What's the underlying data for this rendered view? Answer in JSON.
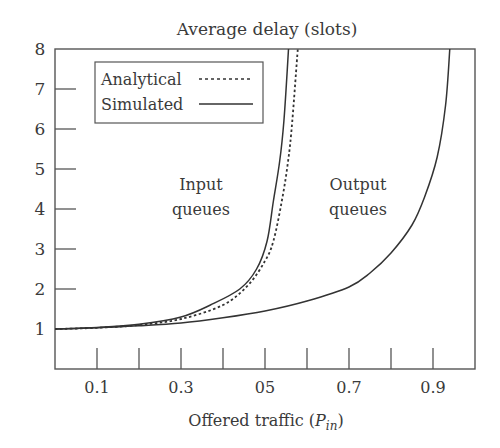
{
  "chart_data": {
    "type": "line",
    "title": "Average delay (slots)",
    "xlabel": "Offered traffic (P_in)",
    "xlabel_main": "Offered traffic (",
    "xlabel_var": "P",
    "xlabel_sub": "in",
    "xlabel_close": ")",
    "ylabel": "Average delay (slots)",
    "xlim": [
      0,
      1.0
    ],
    "ylim": [
      0,
      8
    ],
    "grid": false,
    "legend_position": "upper left",
    "x_ticks": [
      0.1,
      0.2,
      0.3,
      0.4,
      0.5,
      0.6,
      0.7,
      0.8,
      0.9
    ],
    "x_tick_labels": [
      {
        "x": 0.1,
        "label": "0.1"
      },
      {
        "x": 0.3,
        "label": "0.3"
      },
      {
        "x": 0.5,
        "label": "05"
      },
      {
        "x": 0.7,
        "label": "0.7"
      },
      {
        "x": 0.9,
        "label": "0.9"
      }
    ],
    "y_ticks": [
      2,
      3,
      4,
      5,
      6,
      7
    ],
    "y_tick_labels": [
      "1",
      "2",
      "3",
      "4",
      "5",
      "6",
      "7",
      "8"
    ],
    "legend": [
      {
        "label": "Analytical",
        "style": "dotted"
      },
      {
        "label": "Simulated",
        "style": "solid"
      }
    ],
    "annotations": [
      {
        "text": [
          "Input",
          "queues"
        ],
        "x": 0.35,
        "y": 4.3
      },
      {
        "text": [
          "Output",
          "queues"
        ],
        "x": 0.72,
        "y": 4.3
      }
    ],
    "series": [
      {
        "name": "Input queues (Simulated)",
        "style": "solid",
        "x": [
          0,
          0.1,
          0.2,
          0.3,
          0.37,
          0.44,
          0.48,
          0.505,
          0.52,
          0.535,
          0.545,
          0.556
        ],
        "y": [
          1.0,
          1.04,
          1.12,
          1.3,
          1.6,
          2.0,
          2.5,
          3.2,
          4.2,
          5.2,
          6.2,
          8.0
        ]
      },
      {
        "name": "Input queues (Analytical)",
        "style": "dotted",
        "x": [
          0,
          0.1,
          0.2,
          0.3,
          0.4,
          0.46,
          0.5,
          0.52,
          0.54,
          0.555,
          0.565,
          0.578
        ],
        "y": [
          1.0,
          1.03,
          1.1,
          1.25,
          1.6,
          2.1,
          2.7,
          3.2,
          4.2,
          5.2,
          6.2,
          8.0
        ]
      },
      {
        "name": "Output queues (Simulated)",
        "style": "solid",
        "x": [
          0,
          0.1,
          0.2,
          0.3,
          0.4,
          0.5,
          0.6,
          0.7,
          0.75,
          0.8,
          0.85,
          0.88,
          0.91,
          0.93,
          0.94
        ],
        "y": [
          1.0,
          1.03,
          1.08,
          1.15,
          1.28,
          1.45,
          1.7,
          2.05,
          2.4,
          2.9,
          3.6,
          4.3,
          5.3,
          6.6,
          8.0
        ]
      }
    ]
  }
}
